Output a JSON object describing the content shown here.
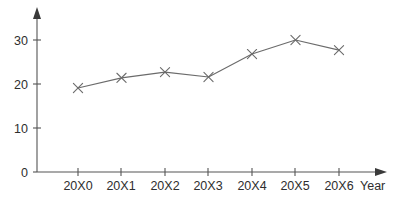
{
  "chart_data": {
    "type": "line",
    "title": "",
    "subtitle": "",
    "xlabel": "Year",
    "ylabel": "",
    "categories": [
      "20X0",
      "20X1",
      "20X2",
      "20X3",
      "20X4",
      "20X5",
      "20X6"
    ],
    "values": [
      19.1,
      21.4,
      22.7,
      21.6,
      26.8,
      30.0,
      27.7
    ],
    "series": [
      {
        "name": "",
        "values": [
          19.1,
          21.4,
          22.7,
          21.6,
          26.8,
          30.0,
          27.7
        ]
      }
    ],
    "ylim": [
      0,
      34
    ],
    "xlim": [
      0,
      8
    ],
    "y_ticks": [
      0,
      10,
      20,
      30
    ],
    "y_tick_labels": [
      "0",
      "10",
      "20",
      "30"
    ],
    "x_tick_labels": [
      "20X0",
      "20X1",
      "20X2",
      "20X3",
      "20X4",
      "20X5",
      "20X6"
    ],
    "grid": false,
    "legend": false,
    "legend_position": "none",
    "marker": "x",
    "line_color": "#6b6b6b",
    "axis_color": "#555555",
    "text_color": "#2e2e2e",
    "background_color": "#ffffff",
    "annotations": []
  },
  "axes": {
    "x_axis_name": "Year",
    "y_axis_name": ""
  }
}
